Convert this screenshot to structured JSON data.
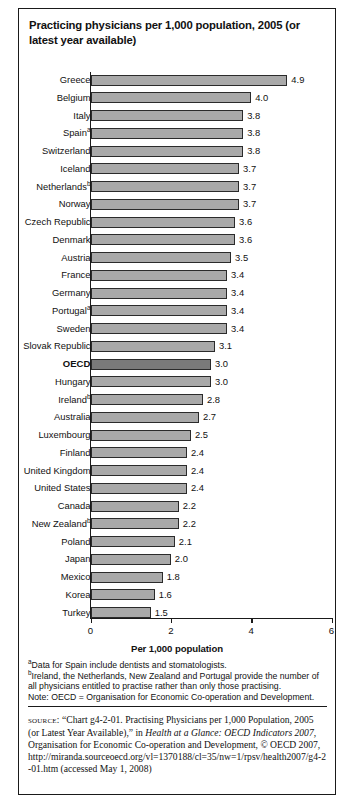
{
  "figure": {
    "title": "Practicing physicians per 1,000 population, 2005 (or latest year available)",
    "axis_title": "Per 1,000 population"
  },
  "chart_data": {
    "type": "bar",
    "orientation": "horizontal",
    "title": "Practicing physicians per 1,000 population, 2005 (or latest year available)",
    "xlabel": "Per 1,000 population",
    "ylabel": "",
    "xlim": [
      0,
      6
    ],
    "xticks": [
      0,
      2,
      4,
      6
    ],
    "xtick_labels": [
      "0",
      "2",
      "4",
      "6"
    ],
    "grid": false,
    "legend": null,
    "categories": [
      "Greece",
      "Belgium",
      "Italy",
      "Spain",
      "Switzerland",
      "Iceland",
      "Netherlands",
      "Norway",
      "Czech Republic",
      "Denmark",
      "Austria",
      "France",
      "Germany",
      "Portugal",
      "Sweden",
      "Slovak Republic",
      "OECD",
      "Hungary",
      "Ireland",
      "Australia",
      "Luxembourg",
      "Finland",
      "United Kingdom",
      "United States",
      "Canada",
      "New Zealand",
      "Poland",
      "Japan",
      "Mexico",
      "Korea",
      "Turkey"
    ],
    "values": [
      4.9,
      4.0,
      3.8,
      3.8,
      3.8,
      3.7,
      3.7,
      3.7,
      3.6,
      3.6,
      3.5,
      3.4,
      3.4,
      3.4,
      3.4,
      3.1,
      3.0,
      3.0,
      2.8,
      2.7,
      2.5,
      2.4,
      2.4,
      2.4,
      2.2,
      2.2,
      2.1,
      2.0,
      1.8,
      1.6,
      1.5
    ],
    "bars": [
      {
        "label": "Greece",
        "footnote": "",
        "value": 4.9,
        "value_label": "4.9",
        "highlight": false
      },
      {
        "label": "Belgium",
        "footnote": "",
        "value": 4.0,
        "value_label": "4.0",
        "highlight": false
      },
      {
        "label": "Italy",
        "footnote": "",
        "value": 3.8,
        "value_label": "3.8",
        "highlight": false
      },
      {
        "label": "Spain",
        "footnote": "a",
        "value": 3.8,
        "value_label": "3.8",
        "highlight": false
      },
      {
        "label": "Switzerland",
        "footnote": "",
        "value": 3.8,
        "value_label": "3.8",
        "highlight": false
      },
      {
        "label": "Iceland",
        "footnote": "",
        "value": 3.7,
        "value_label": "3.7",
        "highlight": false
      },
      {
        "label": "Netherlands",
        "footnote": "b",
        "value": 3.7,
        "value_label": "3.7",
        "highlight": false
      },
      {
        "label": "Norway",
        "footnote": "",
        "value": 3.7,
        "value_label": "3.7",
        "highlight": false
      },
      {
        "label": "Czech Republic",
        "footnote": "",
        "value": 3.6,
        "value_label": "3.6",
        "highlight": false
      },
      {
        "label": "Denmark",
        "footnote": "",
        "value": 3.6,
        "value_label": "3.6",
        "highlight": false
      },
      {
        "label": "Austria",
        "footnote": "",
        "value": 3.5,
        "value_label": "3.5",
        "highlight": false
      },
      {
        "label": "France",
        "footnote": "",
        "value": 3.4,
        "value_label": "3.4",
        "highlight": false
      },
      {
        "label": "Germany",
        "footnote": "",
        "value": 3.4,
        "value_label": "3.4",
        "highlight": false
      },
      {
        "label": "Portugal",
        "footnote": "a",
        "value": 3.4,
        "value_label": "3.4",
        "highlight": false
      },
      {
        "label": "Sweden",
        "footnote": "",
        "value": 3.4,
        "value_label": "3.4",
        "highlight": false
      },
      {
        "label": "Slovak Republic",
        "footnote": "",
        "value": 3.1,
        "value_label": "3.1",
        "highlight": false
      },
      {
        "label": "OECD",
        "footnote": "",
        "value": 3.0,
        "value_label": "3.0",
        "highlight": true
      },
      {
        "label": "Hungary",
        "footnote": "",
        "value": 3.0,
        "value_label": "3.0",
        "highlight": false
      },
      {
        "label": "Ireland",
        "footnote": "b",
        "value": 2.8,
        "value_label": "2.8",
        "highlight": false
      },
      {
        "label": "Australia",
        "footnote": "",
        "value": 2.7,
        "value_label": "2.7",
        "highlight": false
      },
      {
        "label": "Luxembourg",
        "footnote": "",
        "value": 2.5,
        "value_label": "2.5",
        "highlight": false
      },
      {
        "label": "Finland",
        "footnote": "",
        "value": 2.4,
        "value_label": "2.4",
        "highlight": false
      },
      {
        "label": "United Kingdom",
        "footnote": "",
        "value": 2.4,
        "value_label": "2.4",
        "highlight": false
      },
      {
        "label": "United States",
        "footnote": "",
        "value": 2.4,
        "value_label": "2.4",
        "highlight": false
      },
      {
        "label": "Canada",
        "footnote": "",
        "value": 2.2,
        "value_label": "2.2",
        "highlight": false
      },
      {
        "label": "New Zealand",
        "footnote": "b",
        "value": 2.2,
        "value_label": "2.2",
        "highlight": false
      },
      {
        "label": "Poland",
        "footnote": "",
        "value": 2.1,
        "value_label": "2.1",
        "highlight": false
      },
      {
        "label": "Japan",
        "footnote": "",
        "value": 2.0,
        "value_label": "2.0",
        "highlight": false
      },
      {
        "label": "Mexico",
        "footnote": "",
        "value": 1.8,
        "value_label": "1.8",
        "highlight": false
      },
      {
        "label": "Korea",
        "footnote": "",
        "value": 1.6,
        "value_label": "1.6",
        "highlight": false
      },
      {
        "label": "Turkey",
        "footnote": "",
        "value": 1.5,
        "value_label": "1.5",
        "highlight": false
      }
    ],
    "colors": {
      "bar_fill": "#a9a9a9",
      "bar_highlight_fill": "#7a7a7a",
      "bar_stroke": "#2b2b2b",
      "axis": "#1a1a1a",
      "text": "#111111",
      "background": "#ffffff"
    }
  },
  "footnotes": {
    "a_marker": "a",
    "a_text": "Data for Spain include dentists and stomatologists.",
    "b_marker": "b",
    "b_text": "Ireland, the Netherlands, New Zealand and Portugal provide the number of all physicians entitled to practise rather than only those practising.",
    "note": "Note: OECD = Organisation for Economic Co-operation and Development."
  },
  "source": {
    "label": "source:",
    "part1": " “Chart g4-2-01. Practising Physicians per 1,000 Population, 2005 (or Latest Year Available),” in ",
    "italic1": "Health at a Glance: OECD Indicators 2007",
    "part2": ", Organisation for Economic Co-operation and Development, © OECD 2007, ",
    "url": "http://miranda.sourceoecd.org/vl=1370188/cl=35/nw=1/rpsv/health2007/g4-2-01.htm",
    "part3": " (accessed May 1, 2008)"
  }
}
